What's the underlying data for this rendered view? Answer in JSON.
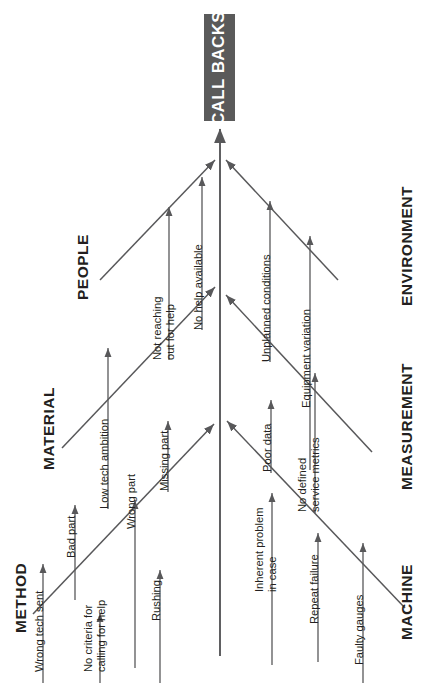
{
  "diagram": {
    "type": "fishbone-ishikawa",
    "orientation": "rotated-90-counterclockwise",
    "head": {
      "label": "CALL BACKS",
      "box_color": "#5a5a5a",
      "text_color": "#ffffff"
    },
    "line_color": "#58585a",
    "background": "#ffffff",
    "branches": [
      {
        "id": "people",
        "label": "PEOPLE",
        "side": "left",
        "causes": [
          {
            "id": "not-reaching-out-for-help",
            "label": "Not reaching\nout for help"
          },
          {
            "id": "no-help-available",
            "label": "No help available"
          }
        ]
      },
      {
        "id": "material",
        "label": "MATERIAL",
        "side": "left",
        "causes": [
          {
            "id": "low-tech-ambition",
            "label": "Low tech ambition"
          },
          {
            "id": "missing-part",
            "label": "Missing part"
          }
        ]
      },
      {
        "id": "method",
        "label": "METHOD",
        "side": "left",
        "causes": [
          {
            "id": "bad-part",
            "label": "Bad part"
          },
          {
            "id": "wrong-part",
            "label": "Wrong part"
          }
        ]
      },
      {
        "id": "method-lower",
        "label": "METHOD",
        "side": "left-outer",
        "causes": [
          {
            "id": "wrong-tech-sent",
            "label": "Wrong tech sent"
          },
          {
            "id": "no-criteria-for-calling-for-help",
            "label": "No criteria for\ncalling for help"
          },
          {
            "id": "rushing",
            "label": "Rushing"
          }
        ]
      },
      {
        "id": "environment",
        "label": "ENVIRONMENT",
        "side": "right",
        "causes": [
          {
            "id": "unplanned-conditions",
            "label": "Unplanned conditions"
          },
          {
            "id": "equipment-variation",
            "label": "Equipment variation"
          }
        ]
      },
      {
        "id": "measurement",
        "label": "MEASUREMENT",
        "side": "right",
        "causes": [
          {
            "id": "poor-data",
            "label": "Poor data"
          },
          {
            "id": "no-defined-service-metrics",
            "label": "No defined\nservice metrics"
          }
        ]
      },
      {
        "id": "machine",
        "label": "MACHINE",
        "side": "right",
        "causes": [
          {
            "id": "inherent-problem-in-case",
            "label": "Inherent problem\nin case"
          },
          {
            "id": "repeat-failure",
            "label": "Repeat failure"
          },
          {
            "id": "faulty-gauges",
            "label": "Faulty gauges"
          }
        ]
      }
    ]
  }
}
